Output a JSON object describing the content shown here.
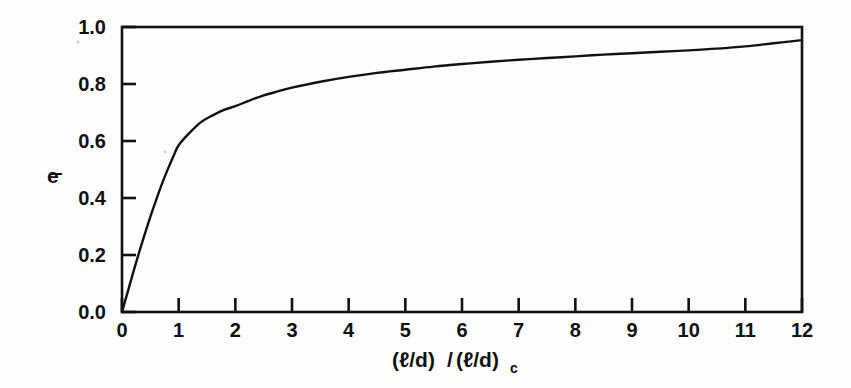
{
  "figure": {
    "kind": "scientific-plot-scan",
    "background_color": "#fdfdfd",
    "ink_color": "#111111"
  },
  "axis_titles": {
    "y_base": "e",
    "y_subscript": "l",
    "y_full": "e_l",
    "x_numerator": "(ℓ/d)",
    "x_slash": "/",
    "x_denominator": "(ℓ/d)",
    "x_subscript": "c",
    "x_full": "(ℓ/d)/(ℓ/d)_c"
  },
  "ticks": {
    "x_labels": [
      "0",
      "1",
      "2",
      "3",
      "4",
      "5",
      "6",
      "7",
      "8",
      "9",
      "10",
      "11",
      "12"
    ],
    "y_labels": [
      "0.0",
      "0.2",
      "0.4",
      "0.6",
      "0.8",
      "1.0"
    ]
  },
  "chart_data": {
    "type": "line",
    "title": "",
    "subtitle": "",
    "xlabel": "(ℓ/d)/(ℓ/d)_c",
    "ylabel": "e_l",
    "xlim": [
      0,
      12
    ],
    "ylim": [
      0.0,
      1.0
    ],
    "xticks": [
      0,
      1,
      2,
      3,
      4,
      5,
      6,
      7,
      8,
      9,
      10,
      11,
      12
    ],
    "yticks": [
      0.0,
      0.2,
      0.4,
      0.6,
      0.8,
      1.0
    ],
    "grid": false,
    "legend": null,
    "legend_position": "none",
    "annotations": [],
    "series": [
      {
        "name": "fiber length efficiency factor",
        "line_color": "#111111",
        "line_width": 2.4,
        "x": [
          0.0,
          0.1,
          0.2,
          0.3,
          0.4,
          0.5,
          0.6,
          0.7,
          0.8,
          0.9,
          1.0,
          1.2,
          1.4,
          1.6,
          1.8,
          2.0,
          2.25,
          2.5,
          2.75,
          3.0,
          3.5,
          4.0,
          4.5,
          5.0,
          5.5,
          6.0,
          6.5,
          7.0,
          7.5,
          8.0,
          8.5,
          9.0,
          9.5,
          10.0,
          10.5,
          11.0,
          11.5,
          12.0
        ],
        "y": [
          0.0,
          0.07,
          0.14,
          0.208,
          0.272,
          0.334,
          0.392,
          0.447,
          0.497,
          0.543,
          0.585,
          0.63,
          0.667,
          0.69,
          0.709,
          0.722,
          0.742,
          0.76,
          0.774,
          0.787,
          0.808,
          0.825,
          0.839,
          0.85,
          0.861,
          0.87,
          0.878,
          0.885,
          0.891,
          0.897,
          0.903,
          0.908,
          0.913,
          0.918,
          0.924,
          0.932,
          0.943,
          0.954
        ]
      }
    ]
  },
  "geometry": {
    "plot_left_px": 122,
    "plot_right_px": 802,
    "plot_top_px": 27,
    "plot_bottom_px": 312
  }
}
